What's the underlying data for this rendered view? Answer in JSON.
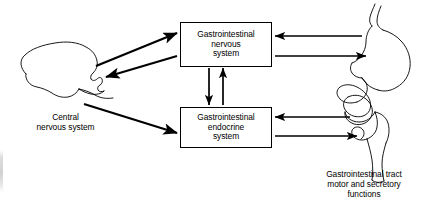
{
  "diagram": {
    "background_color": "#ffffff",
    "stroke_color": "#000000",
    "nodes": [
      {
        "id": "gi-nervous-system",
        "lines": [
          "Gastrointestinal",
          "nervous",
          "system"
        ],
        "shape": "rectangle"
      },
      {
        "id": "gi-endocrine-system",
        "lines": [
          "Gastrointestinal",
          "endocrine",
          "system"
        ],
        "shape": "rectangle"
      }
    ],
    "captions": [
      {
        "id": "central-nervous-system",
        "lines": [
          "Central",
          "nervous system"
        ],
        "organ": "brain-illustration"
      },
      {
        "id": "gi-tract-functions",
        "lines": [
          "Gastrointestinal tract",
          "motor and secretory",
          "functions"
        ],
        "organ": "gi-tract-illustration"
      }
    ],
    "arrows": [
      {
        "id": "brain-to-gi-nervous",
        "from": "central-nervous-system",
        "to": "gi-nervous-system",
        "direction": "right-up"
      },
      {
        "id": "gi-nervous-to-brain",
        "from": "gi-nervous-system",
        "to": "central-nervous-system",
        "direction": "left-down"
      },
      {
        "id": "brain-to-gi-endocrine",
        "from": "central-nervous-system",
        "to": "gi-endocrine-system",
        "direction": "right-down"
      },
      {
        "id": "gi-nervous-to-gi-endocrine",
        "from": "gi-nervous-system",
        "to": "gi-endocrine-system",
        "direction": "down"
      },
      {
        "id": "gi-endocrine-to-gi-nervous",
        "from": "gi-endocrine-system",
        "to": "gi-nervous-system",
        "direction": "up"
      },
      {
        "id": "stomach-to-gi-nervous",
        "from": "gi-tract-functions",
        "to": "gi-nervous-system",
        "direction": "left"
      },
      {
        "id": "gi-nervous-to-stomach",
        "from": "gi-nervous-system",
        "to": "gi-tract-functions",
        "direction": "right"
      },
      {
        "id": "intestine-to-gi-endocrine",
        "from": "gi-tract-functions",
        "to": "gi-endocrine-system",
        "direction": "left"
      },
      {
        "id": "gi-endocrine-to-intestine",
        "from": "gi-endocrine-system",
        "to": "gi-tract-functions",
        "direction": "right"
      }
    ]
  }
}
